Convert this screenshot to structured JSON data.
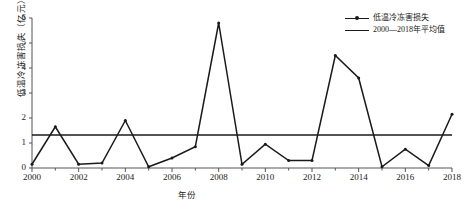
{
  "chart_data": {
    "type": "line",
    "title": "",
    "xlabel": "年份",
    "ylabel": "低温冷冻害损失（亿元）",
    "x": [
      2000,
      2001,
      2002,
      2003,
      2004,
      2005,
      2006,
      2007,
      2008,
      2009,
      2010,
      2011,
      2012,
      2013,
      2014,
      2015,
      2016,
      2017,
      2018
    ],
    "xticks": [
      "2000",
      "2002",
      "2004",
      "2006",
      "2008",
      "2010",
      "2012",
      "2014",
      "2016",
      "2018"
    ],
    "yticks": [
      "0",
      "1",
      "2",
      "3",
      "4",
      "5",
      "6"
    ],
    "xlim": [
      2000,
      2018
    ],
    "ylim": [
      0,
      6
    ],
    "grid": false,
    "legend_position": "top-right",
    "series": [
      {
        "name": "低温冷冻害损失",
        "marker": "dot",
        "color": "#1a1a1a",
        "values": [
          0.15,
          1.65,
          0.15,
          0.2,
          1.9,
          0.05,
          0.4,
          0.85,
          5.8,
          0.15,
          0.95,
          0.3,
          0.3,
          4.5,
          3.6,
          0.05,
          0.75,
          0.1,
          2.15
        ]
      },
      {
        "name": "2000—2018年平均值",
        "marker": "none",
        "color": "#1a1a1a",
        "constant": 1.32
      }
    ]
  },
  "legend": {
    "items": [
      {
        "label": "低温冷冻害损失"
      },
      {
        "label": "2000—2018年平均值"
      }
    ]
  }
}
